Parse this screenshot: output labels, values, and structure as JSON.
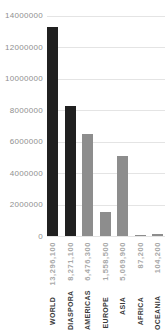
{
  "colors": {
    "background": "#ffffff",
    "bar_primary": "#202020",
    "bar_secondary": "#8d8d8d",
    "gridline": "#e4e4e4",
    "ytick_text": "#8f8f8f",
    "xlabel_name_text": "#3a3a3a",
    "xlabel_value_text": "#a9a9a9"
  },
  "chart_data": {
    "type": "bar",
    "title": "",
    "xlabel": "",
    "ylabel": "",
    "categories": [
      "WORLD",
      "DIASPORA",
      "AMERICAS",
      "EUROPE",
      "ASIA",
      "AFRICA",
      "OCEANIA"
    ],
    "values": [
      13296100,
      8271100,
      6476300,
      1558500,
      5069900,
      87200,
      104200
    ],
    "value_labels": [
      "13,296,100",
      "8,271,100",
      "6,476,300",
      "1,558,500",
      "5,069,900",
      "87,200",
      "104,200"
    ],
    "bar_color_keys": [
      "bar_primary",
      "bar_primary",
      "bar_secondary",
      "bar_secondary",
      "bar_secondary",
      "bar_secondary",
      "bar_secondary"
    ],
    "ylim": [
      0,
      14000000
    ],
    "ytick_step": 2000000,
    "ytick_labels": [
      "0",
      "2000000",
      "4000000",
      "6000000",
      "8000000",
      "10000000",
      "12000000",
      "14000000"
    ],
    "grid": true,
    "legend": false
  }
}
